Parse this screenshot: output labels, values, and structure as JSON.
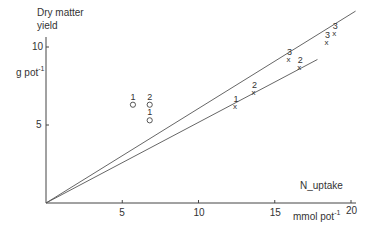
{
  "chart_data": {
    "type": "scatter",
    "title": "",
    "ylabel": "Dry matter yield",
    "ylabel_line1": "Dry matter",
    "ylabel_line2": "yield",
    "yunit": "g pot",
    "yunit_sup": "-1",
    "xlabel": "N_uptake",
    "xunit": "mmol pot",
    "xunit_sup": "-1",
    "xlim": [
      0,
      20
    ],
    "ylim": [
      0,
      11
    ],
    "xticks": [
      5,
      10,
      15,
      20
    ],
    "yticks": [
      5,
      10
    ],
    "grid": false,
    "legend": "none",
    "series": [
      {
        "name": "circles",
        "marker": "o",
        "points": [
          {
            "x": 5.7,
            "y": 6.3,
            "label": "1"
          },
          {
            "x": 6.8,
            "y": 6.3,
            "label": "2"
          },
          {
            "x": 6.8,
            "y": 5.3,
            "label": "1"
          }
        ]
      },
      {
        "name": "crosses",
        "marker": "x",
        "points": [
          {
            "x": 12.4,
            "y": 6.2,
            "label": "1"
          },
          {
            "x": 13.6,
            "y": 7.1,
            "label": "2"
          },
          {
            "x": 15.9,
            "y": 9.2,
            "label": "3"
          },
          {
            "x": 16.6,
            "y": 8.7,
            "label": "2"
          },
          {
            "x": 18.4,
            "y": 10.3,
            "label": "3"
          },
          {
            "x": 18.9,
            "y": 10.9,
            "label": "3"
          }
        ]
      }
    ],
    "lines": [
      {
        "name": "upper-regression-line",
        "from": [
          0,
          0
        ],
        "to": [
          20.3,
          12.3
        ]
      },
      {
        "name": "lower-regression-line",
        "from": [
          0,
          0
        ],
        "to": [
          17.8,
          9.2
        ]
      }
    ]
  }
}
